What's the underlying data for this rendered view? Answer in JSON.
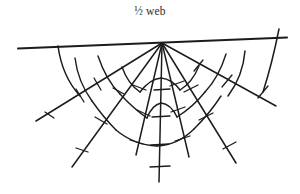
{
  "figure": {
    "caption": "½ web",
    "background_color": "#ffffff",
    "ink_color": "#1c1c1c",
    "width": 300,
    "height": 194
  },
  "diagram": {
    "type": "spider-web-line-drawing",
    "name": "half-web",
    "hub": {
      "x": 162,
      "y": 43
    },
    "frame_thread": {
      "x1": 18,
      "y1": 48.5,
      "x2": 287,
      "y2": 37.5
    },
    "radii": [
      {
        "id": "radius-left-1",
        "x1": 162,
        "y1": 43,
        "x2": 36,
        "y2": 121
      },
      {
        "id": "radius-left-2",
        "x1": 162,
        "y1": 43,
        "x2": 72,
        "y2": 167
      },
      {
        "id": "radius-left-3",
        "x1": 162,
        "y1": 43,
        "x2": 136,
        "y2": 155
      },
      {
        "id": "radius-center",
        "x1": 162,
        "y1": 43,
        "x2": 159,
        "y2": 182
      },
      {
        "id": "radius-right-3",
        "x1": 162,
        "y1": 43,
        "x2": 189,
        "y2": 157
      },
      {
        "id": "radius-right-2",
        "x1": 162,
        "y1": 43,
        "x2": 236,
        "y2": 163
      },
      {
        "id": "radius-right-1",
        "x1": 162,
        "y1": 43,
        "x2": 276,
        "y2": 106
      }
    ],
    "spiral_rings": [
      {
        "id": "spiral-ring-1",
        "label": "innermost capture spiral"
      },
      {
        "id": "spiral-ring-2",
        "label": "middle capture spiral"
      },
      {
        "id": "spiral-ring-3",
        "label": "outer capture spiral"
      },
      {
        "id": "spiral-ring-outer",
        "label": "outermost anchor arcs"
      }
    ],
    "barb_count": 22,
    "radius_count": 7,
    "spiral_ring_count": 4
  }
}
